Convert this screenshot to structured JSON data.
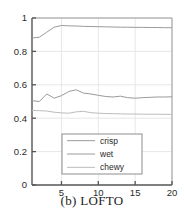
{
  "caption": "(b) LOFTO",
  "chart_data": {
    "type": "line",
    "title": "",
    "xlabel": "",
    "ylabel": "",
    "xlim": [
      1,
      20
    ],
    "ylim": [
      0,
      1
    ],
    "grid": true,
    "legend_position": "lower-center-right",
    "xticks": [
      5,
      10,
      15,
      20
    ],
    "xtick_labels": [
      "5",
      "10",
      "15",
      "20"
    ],
    "yticks": [
      0,
      0.2,
      0.4,
      0.6,
      0.8,
      1
    ],
    "ytick_labels": [
      "0",
      "0.2",
      "0.4",
      "0.6",
      "0.8",
      "1"
    ],
    "x": [
      1,
      2,
      3,
      4,
      5,
      6,
      7,
      8,
      9,
      10,
      11,
      12,
      13,
      14,
      15,
      16,
      17,
      18,
      19,
      20
    ],
    "series": [
      {
        "name": "crisp",
        "color": "#9a9a9a",
        "values": [
          0.88,
          0.885,
          0.915,
          0.945,
          0.955,
          0.953,
          0.952,
          0.95,
          0.949,
          0.948,
          0.947,
          0.946,
          0.945,
          0.945,
          0.944,
          0.944,
          0.943,
          0.943,
          0.942,
          0.942
        ]
      },
      {
        "name": "wet",
        "color": "#9a9a9a",
        "values": [
          0.505,
          0.5,
          0.545,
          0.52,
          0.535,
          0.56,
          0.57,
          0.55,
          0.545,
          0.537,
          0.53,
          0.527,
          0.532,
          0.523,
          0.52,
          0.523,
          0.525,
          0.527,
          0.527,
          0.528
        ]
      },
      {
        "name": "chewy",
        "color": "#bcbcbc",
        "values": [
          0.447,
          0.445,
          0.443,
          0.436,
          0.432,
          0.43,
          0.438,
          0.441,
          0.433,
          0.43,
          0.428,
          0.427,
          0.426,
          0.425,
          0.425,
          0.424,
          0.424,
          0.424,
          0.423,
          0.423
        ]
      }
    ],
    "legend_entries": [
      "crisp",
      "wet",
      "chewy"
    ],
    "axis_color": "#555555",
    "grid_color": "#e4e4e4"
  }
}
